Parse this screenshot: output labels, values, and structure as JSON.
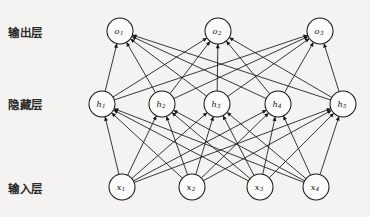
{
  "figure": {
    "background_color": "#f4f3f1",
    "ink_color": "#161616",
    "node_fill": "#fbfbfa",
    "width": 370,
    "height": 217
  },
  "labels": {
    "output_layer": "输出层",
    "hidden_layer": "隐藏层",
    "input_layer": "输入层"
  },
  "layers": [
    {
      "id": "output",
      "label": "输出层",
      "label_x": 8,
      "label_y": 24,
      "y": 31,
      "radius": 13,
      "nodes": [
        {
          "id": "o1",
          "base": "o",
          "sub": "1",
          "x": 120,
          "y": 31
        },
        {
          "id": "o2",
          "base": "o",
          "sub": "2",
          "x": 218,
          "y": 31
        },
        {
          "id": "o3",
          "base": "o",
          "sub": "3",
          "x": 320,
          "y": 31
        }
      ]
    },
    {
      "id": "hidden",
      "label": "隐藏层",
      "label_x": 8,
      "label_y": 96,
      "y": 104,
      "radius": 13,
      "nodes": [
        {
          "id": "h1",
          "base": "h",
          "sub": "1",
          "x": 102,
          "y": 104
        },
        {
          "id": "h2",
          "base": "h",
          "sub": "2",
          "x": 162,
          "y": 104
        },
        {
          "id": "h3",
          "base": "h",
          "sub": "3",
          "x": 217,
          "y": 104
        },
        {
          "id": "h4",
          "base": "h",
          "sub": "4",
          "x": 278,
          "y": 104
        },
        {
          "id": "h5",
          "base": "h",
          "sub": "5",
          "x": 343,
          "y": 104
        }
      ]
    },
    {
      "id": "input",
      "label": "输入层",
      "label_x": 8,
      "label_y": 180,
      "y": 187,
      "radius": 13,
      "nodes": [
        {
          "id": "x1",
          "base": "x",
          "sub": "1",
          "x": 122,
          "y": 187
        },
        {
          "id": "x2",
          "base": "x",
          "sub": "2",
          "x": 192,
          "y": 187
        },
        {
          "id": "x3",
          "base": "x",
          "sub": "3",
          "x": 260,
          "y": 187
        },
        {
          "id": "x4",
          "base": "x",
          "sub": "4",
          "x": 316,
          "y": 187
        }
      ]
    }
  ],
  "connections": [
    {
      "from_layer": "input",
      "to_layer": "hidden",
      "kind": "fully-connected",
      "arrowheads": "at-target"
    },
    {
      "from_layer": "hidden",
      "to_layer": "output",
      "kind": "fully-connected",
      "arrowheads": "at-target"
    }
  ]
}
